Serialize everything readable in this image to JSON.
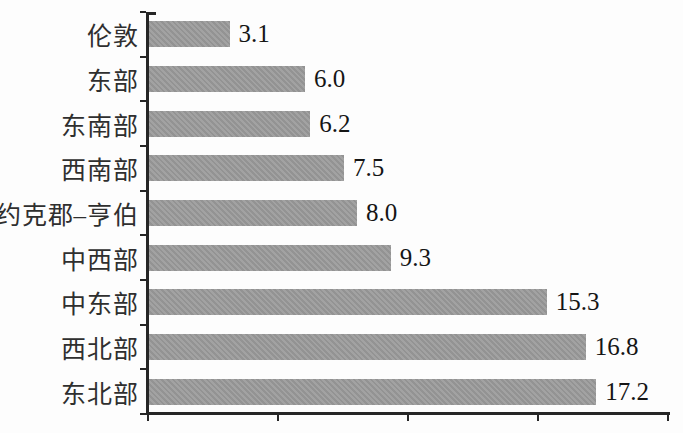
{
  "chart_data": {
    "type": "bar",
    "orientation": "horizontal",
    "title": "",
    "xlabel": "",
    "ylabel": "",
    "categories": [
      "伦敦",
      "东部",
      "东南部",
      "西南部",
      "约克郡–亨伯",
      "中西部",
      "中东部",
      "西北部",
      "东北部"
    ],
    "values": [
      3.1,
      6.0,
      6.2,
      7.5,
      8.0,
      9.3,
      15.3,
      16.8,
      17.2
    ],
    "value_labels": [
      "3.1",
      "6.0",
      "6.2",
      "7.5",
      "8.0",
      "9.3",
      "15.3",
      "16.8",
      "17.2"
    ],
    "xlim": [
      0,
      20
    ],
    "x_ticks": [
      0,
      5,
      10,
      15,
      20
    ],
    "x_tick_labels_visible": false,
    "grid": false,
    "legend": "none",
    "data_labels": "outside-end",
    "bar_color": "#9b9b9b",
    "axis_color": "#262626",
    "label_color": "#2f2f2f",
    "value_color": "#151515",
    "background_color": "#fdfdfd"
  }
}
